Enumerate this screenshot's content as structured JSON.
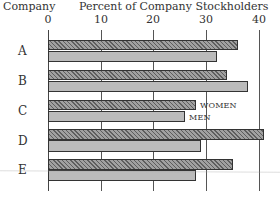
{
  "chart_data": {
    "type": "bar",
    "orientation": "horizontal",
    "title": "Percent of Company Stockholders",
    "ylabel": "Company",
    "xlabel": "Percent of Company Stockholders",
    "categories": [
      "A",
      "B",
      "C",
      "D",
      "E"
    ],
    "series": [
      {
        "name": "WOMEN",
        "values": [
          36,
          34,
          28,
          41,
          35
        ],
        "pattern": "dark hatched"
      },
      {
        "name": "MEN",
        "values": [
          32,
          38,
          26,
          29,
          28
        ],
        "pattern": "light stippled"
      }
    ],
    "xlim": [
      0,
      40
    ],
    "xticks": [
      "0",
      "10",
      "20",
      "30",
      "40"
    ],
    "grid": "vertical lines at 10, 20, 30, 40",
    "legend": {
      "position": "inline, right of company C bars",
      "entries": [
        "WOMEN",
        "MEN"
      ]
    }
  },
  "header": {
    "category_title": "Company",
    "axis_title": "Percent of Company Stockholders"
  },
  "colors": {
    "women_bar": "#7a7a7a",
    "men_bar": "#d0d0d0",
    "outline": "#333333"
  }
}
